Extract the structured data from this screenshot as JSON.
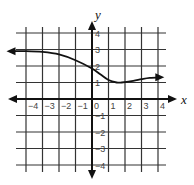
{
  "chart_data": {
    "type": "line",
    "title": "",
    "xlabel": "x",
    "ylabel": "y",
    "xlim": [
      -4,
      4
    ],
    "ylim": [
      -4,
      4
    ],
    "grid": true,
    "x_ticks": [
      "-4",
      "-3",
      "-2",
      "-1",
      "0",
      "1",
      "2",
      "3",
      "4"
    ],
    "y_ticks": [
      "4",
      "3",
      "2",
      "1",
      "-1",
      "-2",
      "-3",
      "-4"
    ],
    "series": [
      {
        "name": "f(x)",
        "arrows": "both",
        "x": [
          -5,
          -4,
          -3,
          -2,
          -1,
          0,
          0.5,
          1,
          1.5,
          1.8,
          2.5,
          3,
          3.5,
          4.2
        ],
        "y": [
          2.9,
          2.9,
          2.85,
          2.7,
          2.35,
          1.85,
          1.5,
          1.15,
          1.0,
          1.0,
          1.1,
          1.2,
          1.28,
          1.32
        ]
      }
    ],
    "colors": {
      "grid": "#333333",
      "axis": "#111111",
      "curve": "#111111",
      "tick_text": "#444444"
    }
  }
}
